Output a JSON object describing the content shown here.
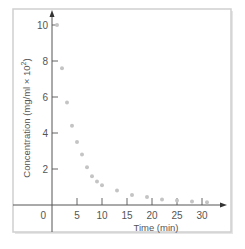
{
  "chart_data": {
    "type": "scatter",
    "title": "",
    "xlabel": "Time (min)",
    "ylabel": "Concentration (mg/ml × 10²)",
    "ylabel_base": "Concentration (mg/ml × 10",
    "ylabel_sup": "2",
    "ylabel_tail": ")",
    "xlim": [
      0,
      35
    ],
    "ylim": [
      0,
      10.5
    ],
    "x_ticks": [
      0,
      5,
      10,
      15,
      20,
      25,
      30
    ],
    "x_tick_labels": [
      "0",
      "5",
      "10",
      "15",
      "20",
      "25",
      "30"
    ],
    "y_ticks": [
      2,
      4,
      6,
      8,
      10
    ],
    "y_tick_labels": [
      "2",
      "4",
      "6",
      "8",
      "10"
    ],
    "grid": false,
    "legend": null,
    "point_color": "#c4c4c4",
    "series": [
      {
        "name": "Concentration",
        "x": [
          1,
          2,
          3,
          4,
          5,
          6,
          7,
          8,
          9,
          10,
          13,
          16,
          19,
          22,
          25,
          28,
          31
        ],
        "y": [
          10.0,
          7.6,
          5.7,
          4.4,
          3.5,
          2.8,
          2.1,
          1.6,
          1.3,
          1.1,
          0.8,
          0.55,
          0.45,
          0.3,
          0.25,
          0.2,
          0.15
        ]
      }
    ]
  }
}
